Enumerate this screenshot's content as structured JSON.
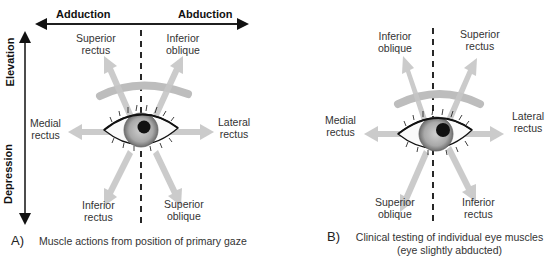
{
  "panel_a": {
    "axes": {
      "horizontal_left": "Adduction",
      "horizontal_right": "Abduction",
      "vertical_top": "Elevation",
      "vertical_bottom": "Depression"
    },
    "muscles": {
      "upper_left": [
        "Superior",
        "rectus"
      ],
      "upper_right": [
        "Inferior",
        "oblique"
      ],
      "left": [
        "Medial",
        "rectus"
      ],
      "right": [
        "Lateral",
        "rectus"
      ],
      "lower_left": [
        "Inferior",
        "rectus"
      ],
      "lower_right": [
        "Superior",
        "oblique"
      ]
    },
    "caption_letter": "A)",
    "caption": "Muscle actions from position of primary gaze"
  },
  "panel_b": {
    "muscles": {
      "upper_left": [
        "Inferior",
        "oblique"
      ],
      "upper_right": [
        "Superior",
        "rectus"
      ],
      "left": [
        "Medial",
        "rectus"
      ],
      "right": [
        "Lateral",
        "rectus"
      ],
      "lower_left": [
        "Superior",
        "oblique"
      ],
      "lower_right": [
        "Inferior",
        "rectus"
      ]
    },
    "caption_letter": "B)",
    "caption_line1": "Clinical testing of individual eye muscles",
    "caption_line2": "(eye slightly abducted)"
  },
  "colors": {
    "arrow": "#c8c8c8",
    "iris": "#9a9a9a",
    "pupil": "#111111",
    "line": "#111111"
  }
}
